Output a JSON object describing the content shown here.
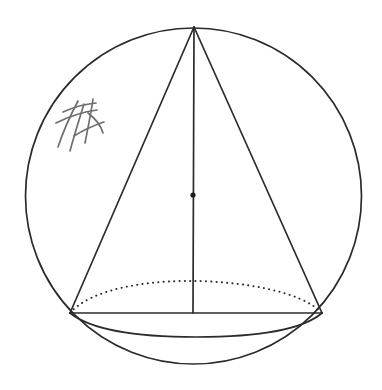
{
  "figure": {
    "background_color": "#ffffff",
    "stroke_color": "#2b2b2b",
    "annotation_color": "#6e6e72",
    "width": 382,
    "height": 390
  },
  "chart_data": {
    "type": "diagram",
    "subtitle": "",
    "xlabel": "",
    "ylabel": "",
    "grid": false,
    "legend": "none",
    "elements": [
      {
        "name": "sphere-outline",
        "shape": "circle",
        "style": "solid",
        "center": [
          193.5,
          196
        ],
        "radius": 168
      },
      {
        "name": "cone-left-slant-edge",
        "shape": "line",
        "style": "solid",
        "from": [
          194,
          27
        ],
        "to": [
          70,
          313
        ]
      },
      {
        "name": "cone-right-slant-edge",
        "shape": "line",
        "style": "solid",
        "from": [
          194,
          27
        ],
        "to": [
          322,
          313
        ]
      },
      {
        "name": "cone-base-diameter",
        "shape": "line",
        "style": "solid",
        "from": [
          70,
          313
        ],
        "to": [
          322,
          313
        ]
      },
      {
        "name": "cone-axis",
        "shape": "line",
        "style": "solid",
        "from": [
          194,
          27
        ],
        "to": [
          193,
          313
        ]
      },
      {
        "name": "base-ellipse-back-arc",
        "shape": "arc",
        "style": "dotted",
        "from": [
          70,
          313
        ],
        "to": [
          322,
          313
        ],
        "apex": [
          196,
          281
        ]
      },
      {
        "name": "base-ellipse-front-arc",
        "shape": "arc",
        "style": "solid",
        "from": [
          70,
          313
        ],
        "to": [
          322,
          313
        ],
        "apex": [
          196,
          337
        ]
      },
      {
        "name": "sphere-center-point",
        "shape": "point",
        "style": "filled-dot",
        "position": [
          193,
          195
        ],
        "radius": 2.6
      },
      {
        "name": "handwritten-annotation",
        "shape": "freehand-scribble",
        "style": "pen-stroke",
        "bounds": [
          55,
          98,
          52,
          54
        ],
        "text": ""
      }
    ],
    "points": [
      {
        "label": "apex",
        "x": 194,
        "y": 27
      },
      {
        "label": "base-left",
        "x": 70,
        "y": 313
      },
      {
        "label": "base-right",
        "x": 322,
        "y": 313
      },
      {
        "label": "sphere-center",
        "x": 193,
        "y": 195
      }
    ],
    "xlim": [
      0,
      382
    ],
    "ylim": [
      0,
      390
    ]
  }
}
